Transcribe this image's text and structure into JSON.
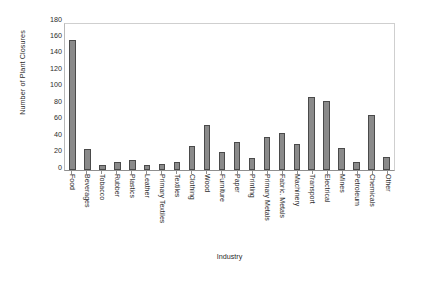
{
  "chart_data": {
    "type": "bar",
    "title": "",
    "xlabel": "Industry",
    "ylabel": "Number of Plant Closures",
    "ylim": [
      0,
      180
    ],
    "ytick_step": 20,
    "ytick_labels": [
      "180",
      "160",
      "140",
      "120",
      "100",
      "80",
      "60",
      "40",
      "20",
      "0"
    ],
    "grid": false,
    "legend": false,
    "bar_color": "#8a8a8a",
    "bar_edge_color": "#4a4a4a",
    "background_color": "#ffffff",
    "categories": [
      "Food",
      "Beverages",
      "Tobacco",
      "Rubber",
      "Plastics",
      "Leather",
      "Primary Textiles",
      "Textiles",
      "Clothing",
      "Wood",
      "Furniture",
      "Paper",
      "Printing",
      "Primary Metals",
      "Fabric. Metals",
      "Machinery",
      "Transport",
      "Electrical",
      "Mines",
      "Petroleum",
      "Chemicals",
      "Other"
    ],
    "values": [
      157,
      25,
      5,
      9,
      12,
      6,
      7,
      9,
      28,
      54,
      21,
      34,
      14,
      40,
      44,
      31,
      88,
      83,
      26,
      9,
      66,
      15
    ]
  }
}
